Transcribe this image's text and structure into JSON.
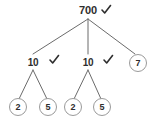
{
  "diagram": {
    "type": "factor-tree",
    "background_color": "#ffffff",
    "stroke_color": "#6b6b6b",
    "circle_stroke_color": "#9a9a9a",
    "text_color": "#2e2e2e",
    "check_color": "#2e2e2e",
    "nodes": [
      {
        "id": "root",
        "label": "700",
        "x": 88,
        "y": 10,
        "circled": false,
        "check": true,
        "check_x": 106,
        "check_y": 10
      },
      {
        "id": "l1-a",
        "label": "10",
        "x": 33,
        "y": 62,
        "circled": false,
        "check": true,
        "check_x": 54,
        "check_y": 60
      },
      {
        "id": "l1-b",
        "label": "10",
        "x": 88,
        "y": 62,
        "circled": false,
        "check": true,
        "check_x": 108,
        "check_y": 60
      },
      {
        "id": "l1-c",
        "label": "7",
        "x": 138,
        "y": 63,
        "circled": true,
        "check": false,
        "check_x": 0,
        "check_y": 0
      },
      {
        "id": "l2-a",
        "label": "2",
        "x": 18,
        "y": 107,
        "circled": true,
        "check": false,
        "check_x": 0,
        "check_y": 0
      },
      {
        "id": "l2-b",
        "label": "5",
        "x": 48,
        "y": 107,
        "circled": true,
        "check": false,
        "check_x": 0,
        "check_y": 0
      },
      {
        "id": "l2-c",
        "label": "2",
        "x": 73,
        "y": 107,
        "circled": true,
        "check": false,
        "check_x": 0,
        "check_y": 0
      },
      {
        "id": "l2-d",
        "label": "5",
        "x": 102,
        "y": 107,
        "circled": true,
        "check": false,
        "check_x": 0,
        "check_y": 0
      }
    ],
    "edges": [
      {
        "from": "root",
        "to": "l1-a",
        "x1": 88,
        "y1": 19,
        "x2": 33,
        "y2": 54
      },
      {
        "from": "root",
        "to": "l1-b",
        "x1": 88,
        "y1": 19,
        "x2": 88,
        "y2": 54
      },
      {
        "from": "root",
        "to": "l1-c",
        "x1": 88,
        "y1": 19,
        "x2": 135,
        "y2": 54
      },
      {
        "from": "l1-a",
        "to": "l2-a",
        "x1": 33,
        "y1": 70,
        "x2": 19,
        "y2": 99
      },
      {
        "from": "l1-a",
        "to": "l2-b",
        "x1": 33,
        "y1": 70,
        "x2": 47,
        "y2": 99
      },
      {
        "from": "l1-b",
        "to": "l2-c",
        "x1": 88,
        "y1": 70,
        "x2": 74,
        "y2": 99
      },
      {
        "from": "l1-b",
        "to": "l2-d",
        "x1": 88,
        "y1": 70,
        "x2": 101,
        "y2": 99
      }
    ],
    "circle_radius": 8.5
  }
}
